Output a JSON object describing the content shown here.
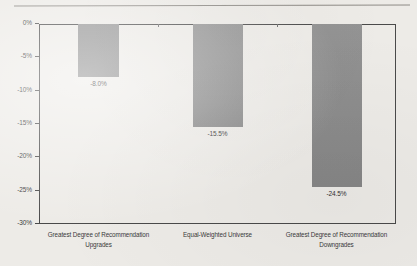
{
  "chart_data": {
    "type": "bar",
    "title": "",
    "subtitle": "",
    "xlabel": "",
    "ylabel": "",
    "categories": [
      "Greatest Degree of Recommendation\nUpgrades",
      "Equal-Weighted Universe",
      "Greatest Degree of Recommendation\nDowngrades"
    ],
    "category_lines": [
      [
        "Greatest Degree of Recommendation",
        "Upgrades"
      ],
      [
        "Equal-Weighted Universe",
        ""
      ],
      [
        "Greatest Degree of Recommendation",
        "Downgrades"
      ]
    ],
    "values": [
      -8.0,
      -15.5,
      -24.5
    ],
    "data_labels": [
      "-8.0%",
      "-15.5%",
      "-24.5%"
    ],
    "ylim": [
      -30,
      0
    ],
    "ytick_values": [
      0,
      -5,
      -10,
      -15,
      -20,
      -25,
      -30
    ],
    "ytick_labels": [
      "0%",
      "-5%",
      "-10%",
      "-15%",
      "-20%",
      "-25%",
      "-30%"
    ],
    "grid": false,
    "legend": null,
    "bar_color": "#8d8d8d",
    "axis_color": "#4a4a4a",
    "background_color": "#edebe7"
  }
}
